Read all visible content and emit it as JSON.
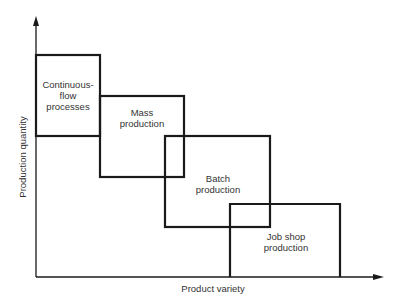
{
  "diagram": {
    "x_axis_label": "Product variety",
    "y_axis_label": "Production quantity",
    "regions": [
      {
        "name": "continuous-flow",
        "lines": [
          "Continuous-",
          "flow",
          "processes"
        ]
      },
      {
        "name": "mass",
        "lines": [
          "Mass",
          "production"
        ]
      },
      {
        "name": "batch",
        "lines": [
          "Batch",
          "production"
        ]
      },
      {
        "name": "job-shop",
        "lines": [
          "Job shop",
          "production"
        ]
      }
    ]
  }
}
